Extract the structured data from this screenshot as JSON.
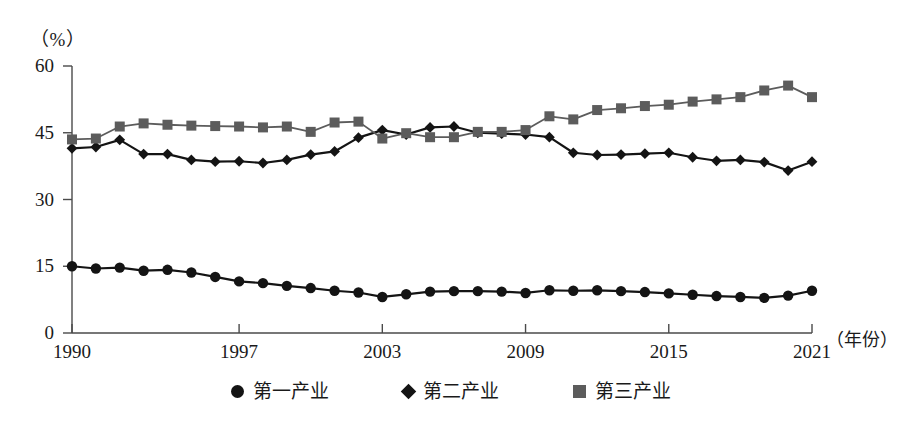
{
  "chart_data": {
    "type": "line",
    "title": "",
    "subtitle": "",
    "ylabel": "（%）",
    "xlabel": "（年份）",
    "grid": false,
    "legend_position": "bottom",
    "ylim": [
      0,
      60
    ],
    "yticks": [
      0,
      15,
      30,
      45,
      60
    ],
    "ytick_labels": [
      "0",
      "15",
      "30",
      "45",
      "60"
    ],
    "xlim": [
      1990,
      2021
    ],
    "xticks": [
      1990,
      1997,
      2003,
      2009,
      2015,
      2021
    ],
    "xtick_labels": [
      "1990",
      "1997",
      "2003",
      "2009",
      "2015",
      "2021"
    ],
    "x": [
      1990,
      1991,
      1992,
      1993,
      1994,
      1995,
      1996,
      1997,
      1998,
      1999,
      2000,
      2001,
      2002,
      2003,
      2004,
      2005,
      2006,
      2007,
      2008,
      2009,
      2010,
      2011,
      2012,
      2013,
      2014,
      2015,
      2016,
      2017,
      2018,
      2019,
      2020,
      2021
    ],
    "series": [
      {
        "name": "第一产业",
        "marker": "circle",
        "color": "#141414",
        "values": [
          15.0,
          14.5,
          14.7,
          14.0,
          14.2,
          13.6,
          12.6,
          11.6,
          11.2,
          10.6,
          10.1,
          9.5,
          9.1,
          8.1,
          8.7,
          9.3,
          9.4,
          9.4,
          9.3,
          9.0,
          9.6,
          9.5,
          9.6,
          9.4,
          9.2,
          8.9,
          8.6,
          8.3,
          8.1,
          7.9,
          8.4,
          9.5
        ]
      },
      {
        "name": "第二产业",
        "marker": "diamond",
        "color": "#141414",
        "values": [
          41.5,
          41.8,
          43.4,
          40.2,
          40.2,
          38.9,
          38.5,
          38.6,
          38.2,
          38.9,
          40.1,
          40.8,
          43.9,
          45.6,
          44.6,
          46.2,
          46.4,
          45.0,
          44.8,
          44.6,
          44.0,
          40.5,
          40.0,
          40.1,
          40.3,
          40.5,
          39.5,
          38.7,
          38.9,
          38.4,
          36.5,
          38.5
        ]
      },
      {
        "name": "第三产业",
        "marker": "square",
        "color": "#5c5c5c",
        "values": [
          43.5,
          43.7,
          46.4,
          47.1,
          46.8,
          46.6,
          46.5,
          46.4,
          46.2,
          46.4,
          45.2,
          47.3,
          47.5,
          43.7,
          44.9,
          44.0,
          44.0,
          45.2,
          45.2,
          45.6,
          48.7,
          48.0,
          50.1,
          50.5,
          51.0,
          51.3,
          52.0,
          52.5,
          53.0,
          54.5,
          55.6,
          53.0
        ]
      }
    ]
  },
  "axis": {
    "y_unit": "（%）",
    "x_unit": "（年份）"
  },
  "legend": {
    "items": [
      {
        "label": "第一产业",
        "marker": "circle-marker",
        "color": "#141414"
      },
      {
        "label": "第二产业",
        "marker": "diamond-marker",
        "color": "#141414"
      },
      {
        "label": "第三产业",
        "marker": "square-marker",
        "color": "#5c5c5c"
      }
    ]
  }
}
